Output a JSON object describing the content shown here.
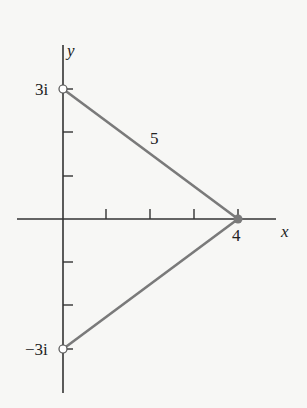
{
  "diagram": {
    "type": "complex-plane-triangle",
    "axes": {
      "x_label": "x",
      "y_label": "y",
      "x_ticks": [
        1,
        2,
        3,
        4
      ],
      "y_ticks": [
        -3,
        -2,
        -1,
        1,
        2,
        3
      ]
    },
    "points": [
      {
        "name": "top",
        "label": "3i",
        "x": 0,
        "y": 3,
        "marker": "open-circle"
      },
      {
        "name": "bottom",
        "label": "−3i",
        "x": 0,
        "y": -3,
        "marker": "open-circle"
      },
      {
        "name": "right",
        "label": "4",
        "x": 4,
        "y": 0,
        "marker": "filled-circle"
      }
    ],
    "segments": [
      {
        "from": "top",
        "to": "right",
        "label": "5"
      },
      {
        "from": "bottom",
        "to": "right",
        "label": ""
      }
    ],
    "colors": {
      "segment": "#7a7a7a",
      "axis": "#333333",
      "background": "#f7f7f5"
    }
  }
}
